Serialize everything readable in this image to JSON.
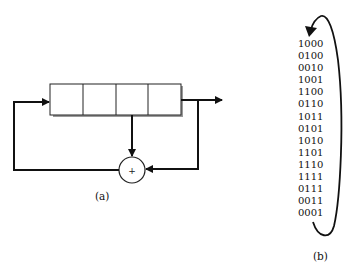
{
  "figure_a": {
    "label": "(a)",
    "register_cells": 4,
    "xor_symbol": "+"
  },
  "figure_b": {
    "label": "(b)",
    "sequence": [
      "1000",
      "0100",
      "0010",
      "1001",
      "1100",
      "0110",
      "1011",
      "0101",
      "1010",
      "1101",
      "1110",
      "1111",
      "0111",
      "0011",
      "0001"
    ]
  }
}
